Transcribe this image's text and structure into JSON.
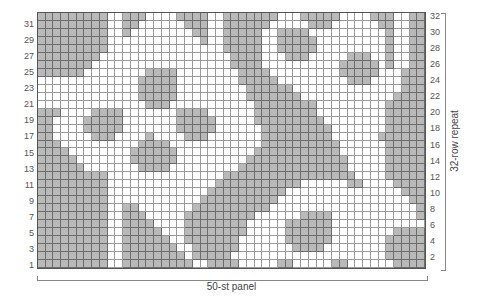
{
  "chart": {
    "title": "",
    "columns": 50,
    "rows": 32,
    "legend": {
      "G": "gray (background / purl area)",
      "W": "white (cable / knit stitches)"
    },
    "colors": {
      "gray": "#b9b9b9",
      "white": "#ffffff",
      "grid_line": "#777777"
    },
    "left_row_labels": [
      "31",
      "29",
      "27",
      "25",
      "23",
      "21",
      "19",
      "17",
      "15",
      "13",
      "11",
      "9",
      "7",
      "5",
      "3",
      "1"
    ],
    "right_row_labels": [
      "32",
      "30",
      "28",
      "26",
      "24",
      "22",
      "20",
      "18",
      "16",
      "14",
      "12",
      "10",
      "8",
      "6",
      "4",
      "2"
    ],
    "bottom_label": "50-st panel",
    "right_label": "32-row repeat",
    "grid_rows_top_to_bottom": [
      "GGGGGGGGGWWGGGWWWWGGGGWWGGGGGGGWWWGGGGGWWWWGGGWWGG",
      "GGGGGGGGGWWGGWWWWWWGGGWWGGGGGGWWWWWGGGWWWWWWGGWWGG",
      "GGGGGGGGGWWGWWWWWWWWGGWWGGGGGWWGGGGWWWWWWWWWWGWWGG",
      "GGGGGGGGGWWWWWWWWWWWWGWWGGGGGWWGGGGGWWWWWWWWWGWWGG",
      "GGGGGGGGGWWWWWWWWWWWWWWWGGGGGWWGGGGGWWWWWWWWWGWWGG",
      "GGGGGGGGWWWWWWWWWWWWWWWWWGGGGWWWGGGWWWWWGGGWWGWWGG",
      "GGGGGGGWWWWWWWWWWWWWWWWWWGGGGWWWWWWWWWWGGGGGWGWWGG",
      "GGGGGGWWWWWWWWGGGGWWWWWWWWGGGGWWWWWWWWWGGGGGWWWGGG",
      "WWWWWWWWWWWWWGGGGGWWWWWWWWGGGGGWWWWWWWWWGGGWWWWGGG",
      "WWWWWWWWWWWWWGGGGGWWWWWWWWWGGGGGGWWWWWWWWWWWWWWGGG",
      "WWWWWWWWWWWWWGGGGGWWWWWWWWWGGGGGGGWWWWWWWWWWWWGGGG",
      "WWWWWWWWWWWWWWGGGWWWWWWWWWWWGGGGGGGGWWWWWWWWWGGGGG",
      "GGGWWWWGGGGWWWWWWWGGGGWWWWWWGGGGGGGGWWWWWWWWWGGGGG",
      "GGWWWWGGGGGWWWWWWWGGGGGWWWWWGGGGGGGGGWWWWWWWWGGGGG",
      "GGWWWWGGGGGWWWWWWWGGGGGWWWWWWGGGGGGGGGWWWWWWWGGGGG",
      "GGWWWWWGGGWWWWGWWWWGGGWWWWWWWGGGGGGGGGWWWWWWGGGGGG",
      "GGGWWWWWWWWWWGGGGWWWWWWWWWWWWGGGGGGGGGGWWWWWWGGGGG",
      "GGGGWWWWWWWWGGGGGGWWWWWWWWWWGGGGGGGGGGGWWWWWWGGGGG",
      "GGGGGWWWWWWWGGGGGGWWWWWWWWWGGGGGGGGGGGGGWWWWWGGGGG",
      "GGGGGGWWWWWWWGGGGWWWWWWWWWGGGGGGGGGGGGGGWWWWWGGGGG",
      "GGGGGGGGGWWWWWWWWWWWWWWWGGGGGGGGGGGGGGGGGWWWWGGGGG",
      "GGGGGGGGGWWWWWWWWWWWWWWGGGGGGGGGGGWWWWWWGGWWWWGGGG",
      "GGGGGGGGGWWWWWWWWWWWWWGGGGGGGGGGWWWWWWWWWWWWWWWGGG",
      "GGGGGGGGGWWWWWWWWWWWWGGGGGGGGGGWWWWWWWWWWWWWWWWWGG",
      "GGGGGGGGGWWGGWWWWWWWGGGGGGGGGGWWWWWWWWWWWWWWWWWWWG",
      "GGGGGGGGGWWGGGWWWWWGGGGGGGGGWWWWWWGGGGWWWWWWWWWWWG",
      "GGGGGGGGGWWGGGGWWWWGGGGGGGGWWWWWGGGGGGWWWWWWWWWWWW",
      "GGGGGGGGGWWGGGGGWWWGGGGGGGGWWWWWGGGGGGWWWWWWWWGGGG",
      "GGGGGGGGGWWGGGGGGWWGGGGGGGWWWWWWGGGGGGWWWWWWWGGGGG",
      "GGGGGGGGGWWGGGGGGGWWGGGGGGWWWWWWWGGGGWWWWWWWWGGGGG",
      "GGGGGGGGGWWGGGGGGGGWGGGGGWWWWWWWWWWWWWWWWWWWWGGGGG",
      "GGGGGGGGGWWGGGGGGGGGWWGGGGWWWWWGGWWWWWGGWWWWWWGGGG"
    ]
  }
}
